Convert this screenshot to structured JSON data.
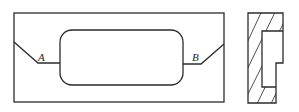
{
  "diagram": {
    "type": "engineering-drawing",
    "views": [
      {
        "name": "front-view",
        "description": "Rectangular plate with central rounded-rectangle opening; slanted notches on left and right edges joined to opening by short horizontal lines",
        "labels": [
          {
            "id": "A",
            "text": "A",
            "position": "left notch vertex"
          },
          {
            "id": "B",
            "text": "B",
            "position": "right notch vertex"
          }
        ]
      },
      {
        "name": "side-view",
        "description": "Sectioned side view with hatching showing stepped profile"
      }
    ],
    "labels": {
      "a": "A",
      "b": "B"
    },
    "colors": {
      "stroke": "#2b2b2b",
      "background": "#ffffff"
    }
  }
}
